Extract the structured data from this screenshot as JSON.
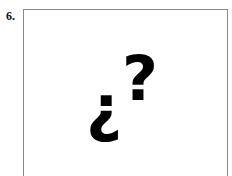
{
  "item": {
    "number": "6.",
    "symbols": {
      "inverted_question": "¿",
      "question": "?"
    }
  },
  "colors": {
    "border": "#8a8a8a",
    "ink": "#000000"
  }
}
